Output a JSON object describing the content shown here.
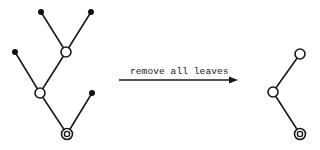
{
  "diagram": {
    "operation_label": "remove all leaves",
    "colors": {
      "stroke": "#1a1a1a",
      "leaf_fill": "#111111",
      "background": "#ffffff"
    },
    "before_tree": {
      "description": "Binary tree with root at bottom (double circle), 2 internal nodes (open circles), 4 leaves (filled dots)",
      "nodes": [
        {
          "id": "r",
          "type": "root",
          "x": 67,
          "y": 134
        },
        {
          "id": "a",
          "type": "internal",
          "x": 40,
          "y": 93
        },
        {
          "id": "b",
          "type": "internal",
          "x": 66,
          "y": 52
        },
        {
          "id": "l1",
          "type": "leaf",
          "x": 41,
          "y": 12
        },
        {
          "id": "l2",
          "type": "leaf",
          "x": 91,
          "y": 12
        },
        {
          "id": "l3",
          "type": "leaf",
          "x": 15,
          "y": 52
        },
        {
          "id": "l4",
          "type": "leaf",
          "x": 92,
          "y": 93
        }
      ],
      "edges": [
        [
          "r",
          "a"
        ],
        [
          "r",
          "l4"
        ],
        [
          "a",
          "b"
        ],
        [
          "a",
          "l3"
        ],
        [
          "b",
          "l1"
        ],
        [
          "b",
          "l2"
        ]
      ]
    },
    "after_tree": {
      "description": "Tree after removing all leaves: root plus two former internal nodes",
      "nodes": [
        {
          "id": "r",
          "type": "root",
          "x": 300,
          "y": 134
        },
        {
          "id": "a",
          "type": "internal",
          "x": 273,
          "y": 92
        },
        {
          "id": "b",
          "type": "internal",
          "x": 300,
          "y": 54
        }
      ],
      "edges": [
        [
          "r",
          "a"
        ],
        [
          "a",
          "b"
        ]
      ]
    },
    "arrow": {
      "x1": 119,
      "x2": 238,
      "y": 80
    }
  }
}
